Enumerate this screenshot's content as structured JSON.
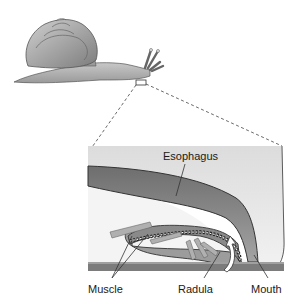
{
  "labels": {
    "esophagus": "Esophagus",
    "muscle": "Muscle",
    "radula": "Radula",
    "mouth": "Mouth"
  },
  "colors": {
    "shell": "#a8a8a8",
    "body": "#b8b8b8",
    "background_panel": "#e6e6e6",
    "esophagus": "#8c8c8c",
    "ground": "#7a7a7a",
    "leader_line": "#333333"
  }
}
